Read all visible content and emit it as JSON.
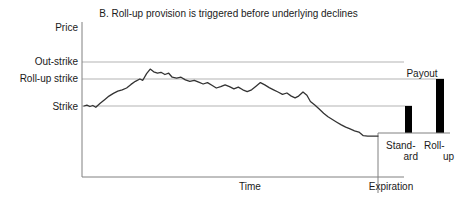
{
  "chart_data": {
    "type": "line",
    "title": "B. Roll-up provision is triggered before underlying declines",
    "xlabel": "Time",
    "ylabel": "Price",
    "grid": true,
    "legend": "none",
    "y_tick_labels": [
      "Price",
      "Out-strike",
      "Roll-up strike",
      "Strike"
    ],
    "x_tick_labels": [
      "Time",
      "Expiration"
    ],
    "reference_lines": [
      {
        "name": "Out-strike",
        "label": "Out-strike",
        "level": 3
      },
      {
        "name": "Roll-up strike",
        "label": "Roll-up strike",
        "level": 2
      },
      {
        "name": "Strike",
        "label": "Strike",
        "level": 1
      }
    ],
    "series": [
      {
        "name": "Underlying price path",
        "description": "Underlying rises above the roll-up strike, triggering the roll-up provision, then declines below the strike by expiration.",
        "points": [
          [
            0.0,
            1.0
          ],
          [
            0.01,
            1.02
          ],
          [
            0.02,
            0.99
          ],
          [
            0.03,
            1.01
          ],
          [
            0.04,
            0.97
          ],
          [
            0.055,
            1.06
          ],
          [
            0.07,
            1.14
          ],
          [
            0.085,
            1.22
          ],
          [
            0.1,
            1.28
          ],
          [
            0.115,
            1.33
          ],
          [
            0.13,
            1.36
          ],
          [
            0.145,
            1.4
          ],
          [
            0.16,
            1.48
          ],
          [
            0.175,
            1.55
          ],
          [
            0.19,
            1.6
          ],
          [
            0.2,
            1.57
          ],
          [
            0.213,
            1.72
          ],
          [
            0.225,
            1.82
          ],
          [
            0.237,
            1.76
          ],
          [
            0.25,
            1.73
          ],
          [
            0.262,
            1.75
          ],
          [
            0.275,
            1.7
          ],
          [
            0.288,
            1.73
          ],
          [
            0.3,
            1.64
          ],
          [
            0.315,
            1.62
          ],
          [
            0.33,
            1.64
          ],
          [
            0.345,
            1.58
          ],
          [
            0.36,
            1.55
          ],
          [
            0.375,
            1.57
          ],
          [
            0.39,
            1.53
          ],
          [
            0.405,
            1.49
          ],
          [
            0.42,
            1.52
          ],
          [
            0.435,
            1.46
          ],
          [
            0.45,
            1.4
          ],
          [
            0.465,
            1.43
          ],
          [
            0.48,
            1.47
          ],
          [
            0.495,
            1.43
          ],
          [
            0.51,
            1.38
          ],
          [
            0.525,
            1.42
          ],
          [
            0.54,
            1.36
          ],
          [
            0.555,
            1.32
          ],
          [
            0.57,
            1.36
          ],
          [
            0.585,
            1.44
          ],
          [
            0.6,
            1.52
          ],
          [
            0.615,
            1.47
          ],
          [
            0.63,
            1.41
          ],
          [
            0.645,
            1.36
          ],
          [
            0.66,
            1.31
          ],
          [
            0.675,
            1.26
          ],
          [
            0.69,
            1.29
          ],
          [
            0.705,
            1.22
          ],
          [
            0.718,
            1.18
          ],
          [
            0.73,
            1.22
          ],
          [
            0.745,
            1.31
          ],
          [
            0.758,
            1.24
          ],
          [
            0.77,
            1.1
          ],
          [
            0.785,
            1.02
          ],
          [
            0.8,
            0.93
          ],
          [
            0.815,
            0.84
          ],
          [
            0.83,
            0.76
          ],
          [
            0.845,
            0.7
          ],
          [
            0.86,
            0.64
          ],
          [
            0.875,
            0.58
          ],
          [
            0.89,
            0.53
          ],
          [
            0.905,
            0.49
          ],
          [
            0.92,
            0.45
          ],
          [
            0.935,
            0.42
          ],
          [
            0.95,
            0.34
          ],
          [
            0.965,
            0.33
          ],
          [
            1.0,
            0.33
          ]
        ]
      }
    ],
    "bars": [
      {
        "name": "standard-payout-bar",
        "label_line1": "Stand-",
        "label_line2": "ard",
        "top_level": "Strike",
        "value": 1.0,
        "color": "#000000"
      },
      {
        "name": "rollup-payout-bar",
        "label_line1": "Roll-",
        "label_line2": "up",
        "top_level": "Roll-up strike",
        "value": 1.6,
        "color": "#000000"
      }
    ],
    "annotations": [
      {
        "name": "payout",
        "text": "Payout"
      }
    ]
  },
  "title": "B. Roll-up provision is triggered before underlying declines",
  "axes": {
    "y_title": "Price",
    "x_title": "Time",
    "expiration_label": "Expiration",
    "ticks": {
      "out_strike": "Out-strike",
      "rollup_strike": "Roll-up strike",
      "strike": "Strike"
    }
  },
  "payout": {
    "heading": "Payout",
    "standard_line1": "Stand-",
    "standard_line2": "ard",
    "rollup_line1": "Roll-",
    "rollup_line2": "up"
  },
  "colors": {
    "line": "#333333",
    "grid": "#b3b3b3",
    "axis": "#808080",
    "bar": "#000000",
    "text": "#1a1a1a"
  }
}
